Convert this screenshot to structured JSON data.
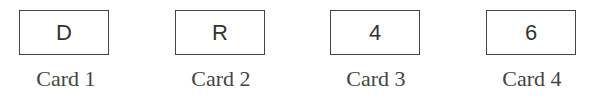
{
  "cards": [
    {
      "face": "D",
      "label": "Card 1"
    },
    {
      "face": "R",
      "label": "Card 2"
    },
    {
      "face": "4",
      "label": "Card 3"
    },
    {
      "face": "6",
      "label": "Card 4"
    }
  ]
}
